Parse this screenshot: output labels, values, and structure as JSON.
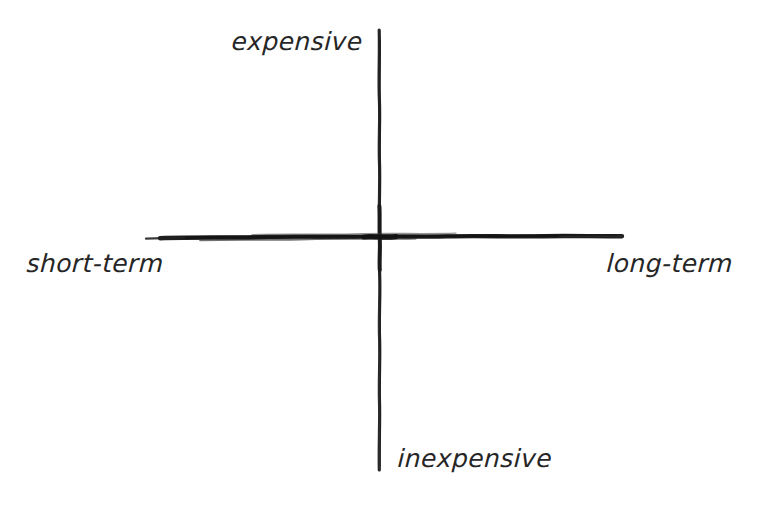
{
  "diagram": {
    "type": "quadrant-matrix",
    "style": "hand-drawn",
    "background_color": "#ffffff",
    "ink_color": "#262626",
    "axes": {
      "vertical": {
        "name": "cost-axis",
        "top_label": "expensive",
        "bottom_label": "inexpensive",
        "x": 379,
        "y_start": 30,
        "y_end": 470
      },
      "horizontal": {
        "name": "time-horizon-axis",
        "left_label": "short-term",
        "right_label": "long-term",
        "y": 237,
        "x_start": 145,
        "x_end": 622
      },
      "origin": {
        "x": 380,
        "y": 237
      }
    },
    "labels": {
      "top": "expensive",
      "bottom": "inexpensive",
      "left": "short-term",
      "right": "long-term"
    },
    "quadrants": [
      {
        "name": "top-left",
        "x_value": "short-term",
        "y_value": "expensive",
        "content": ""
      },
      {
        "name": "top-right",
        "x_value": "long-term",
        "y_value": "expensive",
        "content": ""
      },
      {
        "name": "bottom-left",
        "x_value": "short-term",
        "y_value": "inexpensive",
        "content": ""
      },
      {
        "name": "bottom-right",
        "x_value": "long-term",
        "y_value": "inexpensive",
        "content": ""
      }
    ]
  }
}
